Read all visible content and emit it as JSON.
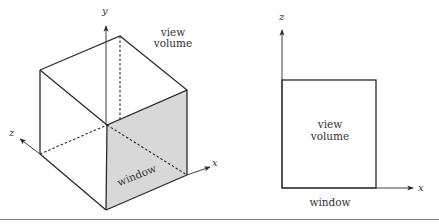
{
  "colors": {
    "stroke": "#2a2a2a",
    "window_fill": "#d8d8d8",
    "rule": "#888888"
  },
  "left_figure": {
    "axis_labels": {
      "y": "y",
      "z": "z",
      "x": "x"
    },
    "view_volume_label_line1": "view",
    "view_volume_label_line2": "volume",
    "window_label": "window"
  },
  "right_figure": {
    "axis_labels": {
      "z": "z",
      "x": "x"
    },
    "view_volume_label_line1": "view",
    "view_volume_label_line2": "volume",
    "window_label": "window"
  }
}
